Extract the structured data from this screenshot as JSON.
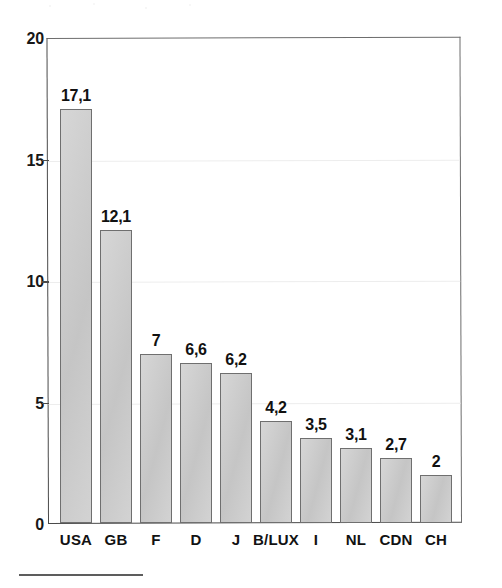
{
  "chart_data": {
    "type": "bar",
    "title": "",
    "subtitle": "",
    "xlabel": "",
    "ylabel": "",
    "categories": [
      "USA",
      "GB",
      "F",
      "D",
      "J",
      "B/LUX",
      "I",
      "NL",
      "CDN",
      "CH"
    ],
    "values": [
      17.1,
      12.1,
      7,
      6.6,
      6.2,
      4.2,
      3.5,
      3.1,
      2.7,
      2
    ],
    "value_labels": [
      "17,1",
      "12,1",
      "7",
      "6,6",
      "6,2",
      "4,2",
      "3,5",
      "3,1",
      "2,7",
      "2"
    ],
    "ylim": [
      0,
      20
    ],
    "y_ticks": [
      0,
      5,
      10,
      15,
      20
    ],
    "y_tick_labels": [
      "0",
      "5",
      "10",
      "15",
      "20"
    ],
    "decimal_separator": ",",
    "grid": "horizontal-faint",
    "legend": "none",
    "bar_fill_color": "#c9c9c9",
    "bar_border_color": "#6f6f6f",
    "axis_color": "#4a4a4a",
    "gridline_color": "#ededed",
    "text_color": "#111111",
    "background_color": "#ffffff"
  },
  "figure": {
    "footnote_rule": true
  }
}
